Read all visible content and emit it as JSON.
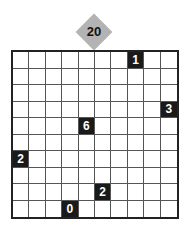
{
  "puzzle": {
    "number": "20",
    "rows": 10,
    "cols": 10,
    "clues": [
      {
        "row": 0,
        "col": 7,
        "value": "1"
      },
      {
        "row": 3,
        "col": 9,
        "value": "3"
      },
      {
        "row": 4,
        "col": 4,
        "value": "6"
      },
      {
        "row": 6,
        "col": 0,
        "value": "2"
      },
      {
        "row": 8,
        "col": 5,
        "value": "2"
      },
      {
        "row": 9,
        "col": 3,
        "value": "0"
      }
    ]
  },
  "colors": {
    "badge": "#b3b3b3",
    "clue_cell": "#1a1a1a",
    "grid_line": "#555555"
  }
}
